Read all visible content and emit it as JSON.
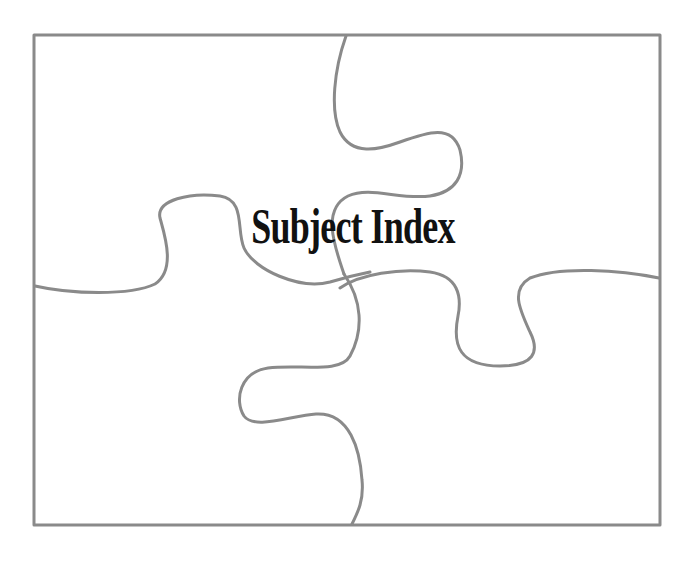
{
  "page": {
    "title": "Subject Index"
  },
  "style": {
    "line_color": "#8a8a8a",
    "title_color": "#111111",
    "background": "#ffffff"
  }
}
